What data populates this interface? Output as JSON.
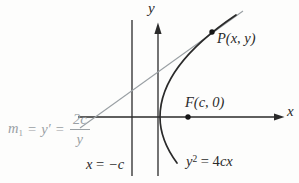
{
  "figure": {
    "type": "math-diagram",
    "equation": "y^2 = 4cx",
    "focus": "F(c, 0)",
    "directrix": "x = -c",
    "tangent_slope": "m1 = y' = 2c/y",
    "point_on_curve": "P(x, y)"
  },
  "colors": {
    "bg": "#fdfdfc",
    "ink": "#2a2a2a",
    "muted": "#9aa0a4"
  },
  "labels": {
    "y_axis": "y",
    "x_axis": "x",
    "point_p": "P(x, y)",
    "focus": "F(c, 0)",
    "directrix": {
      "var": "x",
      "eq": " = ",
      "val": "−c"
    },
    "curve": {
      "base": "y",
      "sup": "2",
      "eq": " = 4",
      "vars": "cx"
    },
    "slope": {
      "m": "m",
      "sub": "1",
      "eq1": "=",
      "yprime": "y′",
      "eq2": "=",
      "num": "2c",
      "den": "y"
    }
  }
}
